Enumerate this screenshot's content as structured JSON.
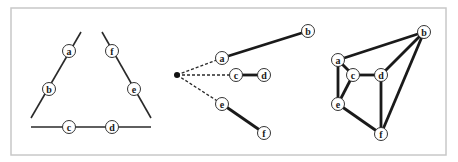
{
  "figure": {
    "panels": [
      {
        "id": "left",
        "name": "triangle-panel",
        "segments": [
          {
            "x1": 81,
            "y1": 32,
            "x2": 31,
            "y2": 118,
            "style": "thin"
          },
          {
            "x1": 102,
            "y1": 32,
            "x2": 151,
            "y2": 118,
            "style": "thin"
          },
          {
            "x1": 31,
            "y1": 127,
            "x2": 151,
            "y2": 127,
            "style": "thin"
          }
        ],
        "nodes": [
          {
            "label": "a",
            "x": 69,
            "y": 51
          },
          {
            "label": "b",
            "x": 49,
            "y": 89
          },
          {
            "label": "c",
            "x": 69,
            "y": 127
          },
          {
            "label": "d",
            "x": 112,
            "y": 127
          },
          {
            "label": "e",
            "x": 134,
            "y": 89
          },
          {
            "label": "f",
            "x": 112,
            "y": 51
          }
        ]
      },
      {
        "id": "middle",
        "name": "tree-panel",
        "root": {
          "x": 177,
          "y": 75
        },
        "segments": [
          {
            "x1": 177,
            "y1": 75,
            "x2": 222,
            "y2": 58,
            "style": "dashed"
          },
          {
            "x1": 177,
            "y1": 75,
            "x2": 236,
            "y2": 75,
            "style": "dashed"
          },
          {
            "x1": 177,
            "y1": 75,
            "x2": 222,
            "y2": 104,
            "style": "dashed"
          },
          {
            "x1": 222,
            "y1": 58,
            "x2": 308,
            "y2": 31,
            "style": "thick"
          },
          {
            "x1": 236,
            "y1": 75,
            "x2": 264,
            "y2": 75,
            "style": "thick"
          },
          {
            "x1": 222,
            "y1": 104,
            "x2": 264,
            "y2": 133,
            "style": "thick"
          }
        ],
        "nodes": [
          {
            "label": "a",
            "x": 222,
            "y": 58
          },
          {
            "label": "b",
            "x": 308,
            "y": 31
          },
          {
            "label": "c",
            "x": 236,
            "y": 75
          },
          {
            "label": "d",
            "x": 264,
            "y": 75
          },
          {
            "label": "e",
            "x": 222,
            "y": 104
          },
          {
            "label": "f",
            "x": 264,
            "y": 133
          }
        ]
      },
      {
        "id": "right",
        "name": "graph-panel",
        "segments": [
          {
            "x1": 338,
            "y1": 60,
            "x2": 424,
            "y2": 32,
            "style": "thick"
          },
          {
            "x1": 338,
            "y1": 60,
            "x2": 353,
            "y2": 75,
            "style": "thick"
          },
          {
            "x1": 338,
            "y1": 60,
            "x2": 338,
            "y2": 104,
            "style": "thick"
          },
          {
            "x1": 353,
            "y1": 75,
            "x2": 381,
            "y2": 75,
            "style": "thick"
          },
          {
            "x1": 353,
            "y1": 75,
            "x2": 338,
            "y2": 104,
            "style": "thick"
          },
          {
            "x1": 381,
            "y1": 75,
            "x2": 424,
            "y2": 32,
            "style": "thick"
          },
          {
            "x1": 381,
            "y1": 75,
            "x2": 381,
            "y2": 134,
            "style": "thick"
          },
          {
            "x1": 338,
            "y1": 104,
            "x2": 381,
            "y2": 134,
            "style": "thick"
          },
          {
            "x1": 424,
            "y1": 32,
            "x2": 381,
            "y2": 134,
            "style": "thick"
          }
        ],
        "nodes": [
          {
            "label": "a",
            "x": 338,
            "y": 60
          },
          {
            "label": "b",
            "x": 424,
            "y": 32
          },
          {
            "label": "c",
            "x": 353,
            "y": 75
          },
          {
            "label": "d",
            "x": 381,
            "y": 75
          },
          {
            "label": "e",
            "x": 338,
            "y": 104
          },
          {
            "label": "f",
            "x": 381,
            "y": 134
          }
        ]
      }
    ],
    "node_radius": 6.5,
    "frame": {
      "x": 11,
      "y": 8,
      "width": 435,
      "height": 147
    }
  }
}
